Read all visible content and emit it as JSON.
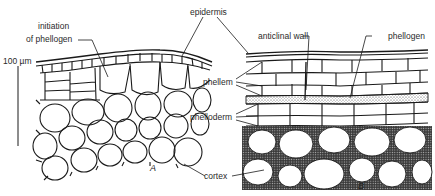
{
  "figure": {
    "labels": {
      "initiation": "initiation",
      "of_phellogen": "of phellogen",
      "epidermis": "epidermis",
      "anticlinal_wall": "anticlinal wall",
      "phellogen": "phellogen",
      "phellem": "phellem",
      "phelloderm": "phelloderm",
      "cortex": "cortex",
      "scale_bar": "100 µm"
    },
    "panels": {
      "a": "A",
      "b": "B"
    },
    "colors": {
      "line": "#1a1a1a",
      "background": "#ffffff",
      "stipple": "#555555"
    }
  }
}
